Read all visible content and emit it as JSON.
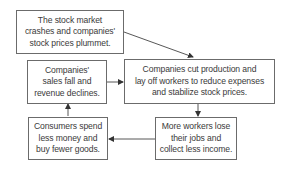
{
  "diagram": {
    "type": "flowchart-cycle",
    "nodes": [
      {
        "id": "n1",
        "lines": [
          "The stock market",
          "crashes and companies'",
          "stock prices plummet."
        ]
      },
      {
        "id": "n2",
        "lines": [
          "Companies'",
          "sales fall and",
          "revenue declines."
        ]
      },
      {
        "id": "n3",
        "lines": [
          "Companies cut production and",
          "lay off workers to reduce expenses",
          "and stabilize stock prices."
        ]
      },
      {
        "id": "n4",
        "lines": [
          "Consumers spend",
          "less money and",
          "buy fewer goods."
        ]
      },
      {
        "id": "n5",
        "lines": [
          "More workers lose",
          "their jobs and",
          "collect less income."
        ]
      }
    ],
    "edges": [
      {
        "from": "n1",
        "to": "n3"
      },
      {
        "from": "n2",
        "to": "n3"
      },
      {
        "from": "n3",
        "to": "n5"
      },
      {
        "from": "n5",
        "to": "n4"
      },
      {
        "from": "n4",
        "to": "n2"
      }
    ],
    "colors": {
      "border": "#6b6b6b",
      "text": "#3a3a3a",
      "arrow": "#333333",
      "background": "#ffffff"
    }
  }
}
